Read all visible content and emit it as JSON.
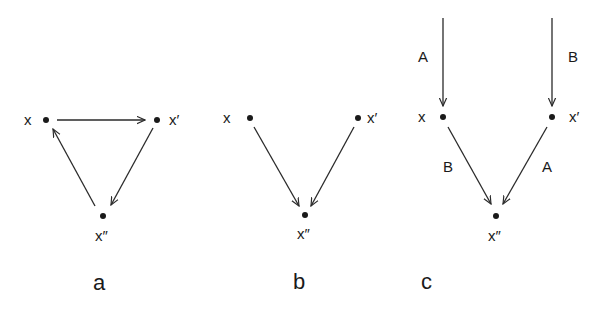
{
  "diagram": {
    "colors": {
      "line": "#2a2a2a",
      "text": "#1a1a1a",
      "background": "#ffffff"
    },
    "panels": [
      {
        "id": "a",
        "label": "a",
        "nodes": [
          {
            "id": "x",
            "label": "x"
          },
          {
            "id": "x1",
            "label": "x′"
          },
          {
            "id": "x2",
            "label": "x″"
          }
        ],
        "edges": [
          {
            "from": "x",
            "to": "x1"
          },
          {
            "from": "x1",
            "to": "x2"
          },
          {
            "from": "x2",
            "to": "x"
          }
        ]
      },
      {
        "id": "b",
        "label": "b",
        "nodes": [
          {
            "id": "x",
            "label": "x"
          },
          {
            "id": "x1",
            "label": "x′"
          },
          {
            "id": "x2",
            "label": "x″"
          }
        ],
        "edges": [
          {
            "from": "x",
            "to": "x2"
          },
          {
            "from": "x1",
            "to": "x2"
          }
        ]
      },
      {
        "id": "c",
        "label": "c",
        "nodes": [
          {
            "id": "x",
            "label": "x"
          },
          {
            "id": "x1",
            "label": "x′"
          },
          {
            "id": "x2",
            "label": "x″"
          }
        ],
        "edges": [
          {
            "from": "input-left",
            "to": "x",
            "label": "A"
          },
          {
            "from": "input-right",
            "to": "x1",
            "label": "B"
          },
          {
            "from": "x",
            "to": "x2",
            "label": "B"
          },
          {
            "from": "x1",
            "to": "x2",
            "label": "A"
          }
        ]
      }
    ]
  }
}
